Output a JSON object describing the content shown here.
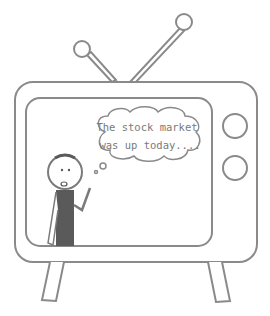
{
  "illustration": {
    "subject": "television",
    "speech_bubble": {
      "line1": "The stock market",
      "line2": "was up today...."
    },
    "colors": {
      "stroke": "#8a8a8a",
      "figure_body": "#5a5a5a",
      "background": "#ffffff"
    },
    "icons": [
      "tv-icon",
      "antenna-icon",
      "knob-icon",
      "stick-figure-icon",
      "thought-bubble-icon"
    ]
  }
}
